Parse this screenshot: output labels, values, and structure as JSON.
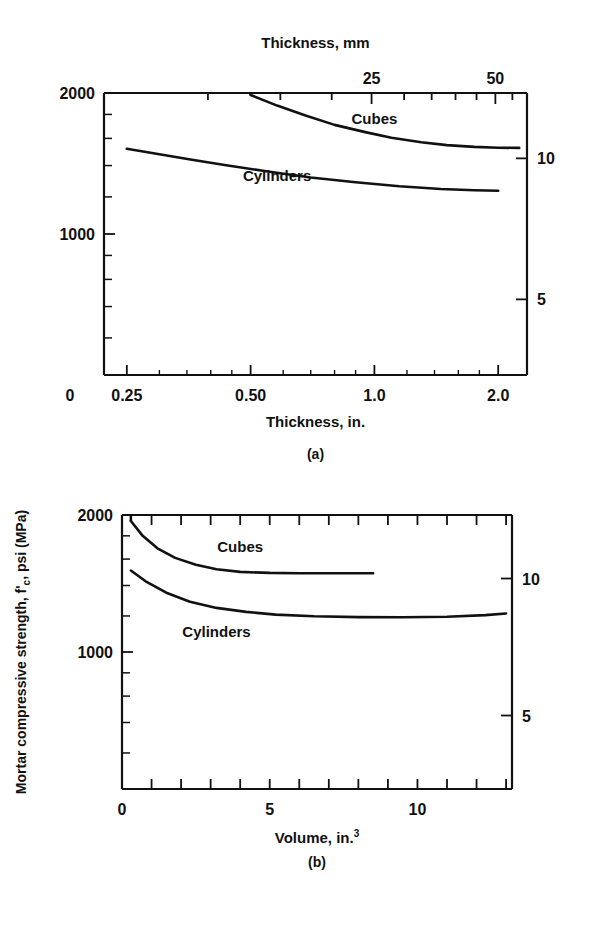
{
  "figure": {
    "background": "#ffffff",
    "ink": "#111111",
    "y_axis_label_main": "Mortar compressive strength, f",
    "y_axis_label_sub": "c",
    "y_axis_label_prime": "'",
    "y_axis_label_tail": ", psi  (MPa)"
  },
  "panels": [
    {
      "id": "a",
      "caption": "(a)",
      "top_axis_title": "Thickness, mm",
      "bottom_axis_title": "Thickness, in.",
      "top_tick_labels": [
        "25",
        "50"
      ],
      "top_tick_values": [
        25,
        50
      ],
      "bottom_tick_labels": [
        "0",
        "0.25",
        "0.50",
        "1.0",
        "2.0"
      ],
      "bottom_tick_values": [
        0.25,
        0.5,
        1.0,
        2.0
      ],
      "left_tick_labels": [
        "2000",
        "1000"
      ],
      "left_tick_values": [
        2000,
        1000
      ],
      "right_tick_labels": [
        "10",
        "5"
      ],
      "right_tick_values": [
        10,
        5
      ],
      "series": [
        {
          "name": "Cubes",
          "label": "Cubes"
        },
        {
          "name": "Cylinders",
          "label": "Cylinders"
        }
      ]
    },
    {
      "id": "b",
      "caption": "(b)",
      "bottom_axis_title_main": "Volume, in.",
      "bottom_axis_title_sup": "3",
      "bottom_tick_labels": [
        "0",
        "5",
        "10"
      ],
      "bottom_tick_values": [
        0,
        5,
        10
      ],
      "left_tick_labels": [
        "2000",
        "1000"
      ],
      "left_tick_values": [
        2000,
        1000
      ],
      "right_tick_labels": [
        "10",
        "5"
      ],
      "right_tick_values": [
        10,
        5
      ],
      "series": [
        {
          "name": "Cubes",
          "label": "Cubes"
        },
        {
          "name": "Cylinders",
          "label": "Cylinders"
        }
      ]
    }
  ],
  "chart_data": [
    {
      "type": "line",
      "panel": "a",
      "title": "Mortar compressive strength vs. specimen thickness",
      "xlabel": "Thickness, in.",
      "xlabel_secondary": "Thickness, mm",
      "ylabel": "Mortar compressive strength, f'c, psi (MPa)",
      "ylabel_secondary": "MPa",
      "xscale": "log",
      "yscale": "log",
      "xlim": [
        0.22,
        2.35
      ],
      "ylim": [
        500,
        2000
      ],
      "xticks": [
        0.25,
        0.5,
        1.0,
        2.0
      ],
      "xticklabels": [
        "0.25",
        "0.50",
        "1.0",
        "2.0"
      ],
      "xticks_secondary_mm": [
        25,
        50
      ],
      "xticklabels_secondary": [
        "25",
        "50"
      ],
      "yticks": [
        1000,
        2000
      ],
      "yticklabels": [
        "1000",
        "2000"
      ],
      "yticks_minor": [
        600,
        700,
        800,
        900,
        1200,
        1400,
        1600,
        1800
      ],
      "yticks_secondary_mpa": [
        5,
        10
      ],
      "yticklabels_secondary": [
        "5",
        "10"
      ],
      "grid": false,
      "legend": "inline-annotation",
      "series": [
        {
          "name": "Cubes",
          "annotation": "Cubes",
          "annotation_x": 1.0,
          "annotation_y": 1720,
          "x": [
            0.5,
            0.58,
            0.68,
            0.8,
            0.95,
            1.1,
            1.3,
            1.5,
            1.75,
            2.0,
            2.25
          ],
          "y": [
            1980,
            1880,
            1790,
            1710,
            1650,
            1605,
            1570,
            1548,
            1535,
            1528,
            1527
          ]
        },
        {
          "name": "Cylinders",
          "annotation": "Cylinders",
          "annotation_x": 0.58,
          "annotation_y": 1300,
          "x": [
            0.25,
            0.3,
            0.36,
            0.44,
            0.55,
            0.7,
            0.9,
            1.15,
            1.45,
            1.75,
            2.0
          ],
          "y": [
            1520,
            1480,
            1440,
            1400,
            1360,
            1320,
            1290,
            1265,
            1248,
            1240,
            1237
          ]
        }
      ]
    },
    {
      "type": "line",
      "panel": "b",
      "title": "Mortar compressive strength vs. specimen volume",
      "xlabel": "Volume, in.3",
      "ylabel": "Mortar compressive strength, f'c, psi (MPa)",
      "ylabel_secondary": "MPa",
      "xscale": "linear",
      "yscale": "log",
      "xlim": [
        0,
        13.2
      ],
      "ylim": [
        500,
        2000
      ],
      "xticks": [
        0,
        5,
        10
      ],
      "xticklabels": [
        "0",
        "5",
        "10"
      ],
      "xticks_minor": [
        1,
        2,
        3,
        4,
        6,
        7,
        8,
        9,
        11,
        12,
        13
      ],
      "yticks": [
        1000,
        2000
      ],
      "yticklabels": [
        "1000",
        "2000"
      ],
      "yticks_minor": [
        600,
        700,
        800,
        900,
        1200,
        1400,
        1600,
        1800
      ],
      "yticks_secondary_mpa": [
        5,
        10
      ],
      "yticklabels_secondary": [
        "5",
        "10"
      ],
      "grid": false,
      "legend": "inline-annotation",
      "series": [
        {
          "name": "Cubes",
          "annotation": "Cubes",
          "annotation_x": 4.0,
          "annotation_y": 1660,
          "x": [
            0.3,
            0.7,
            1.2,
            1.8,
            2.5,
            3.2,
            4.0,
            5.0,
            6.0,
            7.0,
            8.0,
            8.5
          ],
          "y": [
            1940,
            1800,
            1690,
            1610,
            1555,
            1520,
            1500,
            1492,
            1490,
            1490,
            1490,
            1490
          ]
        },
        {
          "name": "Cylinders",
          "annotation": "Cylinders",
          "annotation_x": 3.2,
          "annotation_y": 1080,
          "x": [
            0.3,
            0.8,
            1.5,
            2.3,
            3.2,
            4.2,
            5.2,
            6.5,
            8.0,
            9.5,
            11.0,
            12.3,
            13.0
          ],
          "y": [
            1510,
            1430,
            1350,
            1290,
            1250,
            1225,
            1208,
            1198,
            1193,
            1192,
            1195,
            1205,
            1215
          ]
        }
      ]
    }
  ]
}
